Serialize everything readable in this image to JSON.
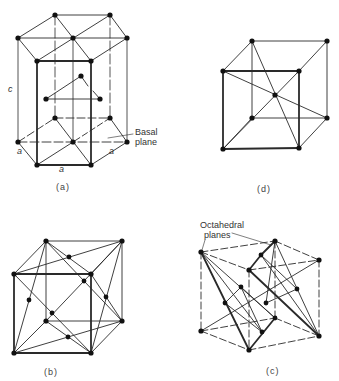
{
  "figure": {
    "panels": [
      {
        "id": "a",
        "caption": "(a)",
        "structure": "hexagonal close-packed",
        "labels": {
          "c": "c",
          "a_left": "a",
          "a_bottom": "a",
          "a_right": "a",
          "basal": "Basal plane"
        }
      },
      {
        "id": "d",
        "caption": "(d)",
        "structure": "body-centered cubic"
      },
      {
        "id": "b",
        "caption": "(b)",
        "structure": "face-centered cubic"
      },
      {
        "id": "c",
        "caption": "(c)",
        "structure": "face-centered cubic with octahedral planes",
        "labels": {
          "octahedral_line1": "Octahedral",
          "octahedral_line2": "planes"
        }
      }
    ]
  },
  "colors": {
    "line": "#2a2a2a",
    "atom": "#111111",
    "text": "#333333"
  }
}
